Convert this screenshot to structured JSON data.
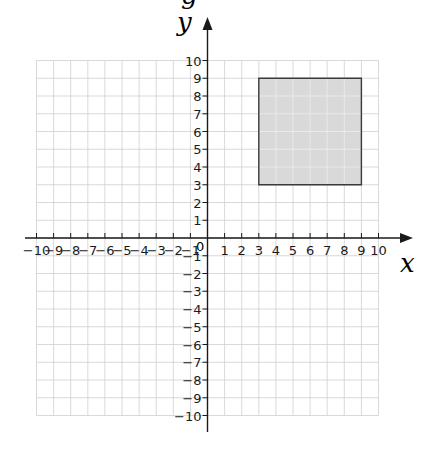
{
  "figure": {
    "cropped_top_text": "g",
    "x_axis_title": "x",
    "y_axis_title": "y",
    "origin_label": "0"
  },
  "chart_data": {
    "type": "coordinate-grid",
    "title": "",
    "xlabel": "x",
    "ylabel": "y",
    "xlim": [
      -10,
      10
    ],
    "ylim": [
      -10,
      10
    ],
    "grid": true,
    "x_ticks": [
      -10,
      -9,
      -8,
      -7,
      -6,
      -5,
      -4,
      -3,
      -2,
      -1,
      1,
      2,
      3,
      4,
      5,
      6,
      7,
      8,
      9,
      10
    ],
    "y_ticks": [
      -10,
      -9,
      -8,
      -7,
      -6,
      -5,
      -4,
      -3,
      -2,
      -1,
      1,
      2,
      3,
      4,
      5,
      6,
      7,
      8,
      9,
      10
    ],
    "x_tick_labels": [
      "−10",
      "−9",
      "−8",
      "−7",
      "−6",
      "−5",
      "−4",
      "−3",
      "−2",
      "−1",
      "1",
      "2",
      "3",
      "4",
      "5",
      "6",
      "7",
      "8",
      "9",
      "10"
    ],
    "y_tick_labels": [
      "−10",
      "−9",
      "−8",
      "−7",
      "−6",
      "−5",
      "−4",
      "−3",
      "−2",
      "−1",
      "1",
      "2",
      "3",
      "4",
      "5",
      "6",
      "7",
      "8",
      "9",
      "10"
    ],
    "shapes": [
      {
        "type": "square",
        "vertices": [
          [
            3,
            3
          ],
          [
            9,
            3
          ],
          [
            9,
            9
          ],
          [
            3,
            9
          ]
        ],
        "fill": "#d9d9d9",
        "stroke": "#3a3a3a"
      }
    ]
  },
  "colors": {
    "grid": "#cfcfcf",
    "axis": "#1a1a1a",
    "shape_fill": "#d9d9d9",
    "shape_stroke": "#3a3a3a",
    "text": "#1a1a1a"
  }
}
